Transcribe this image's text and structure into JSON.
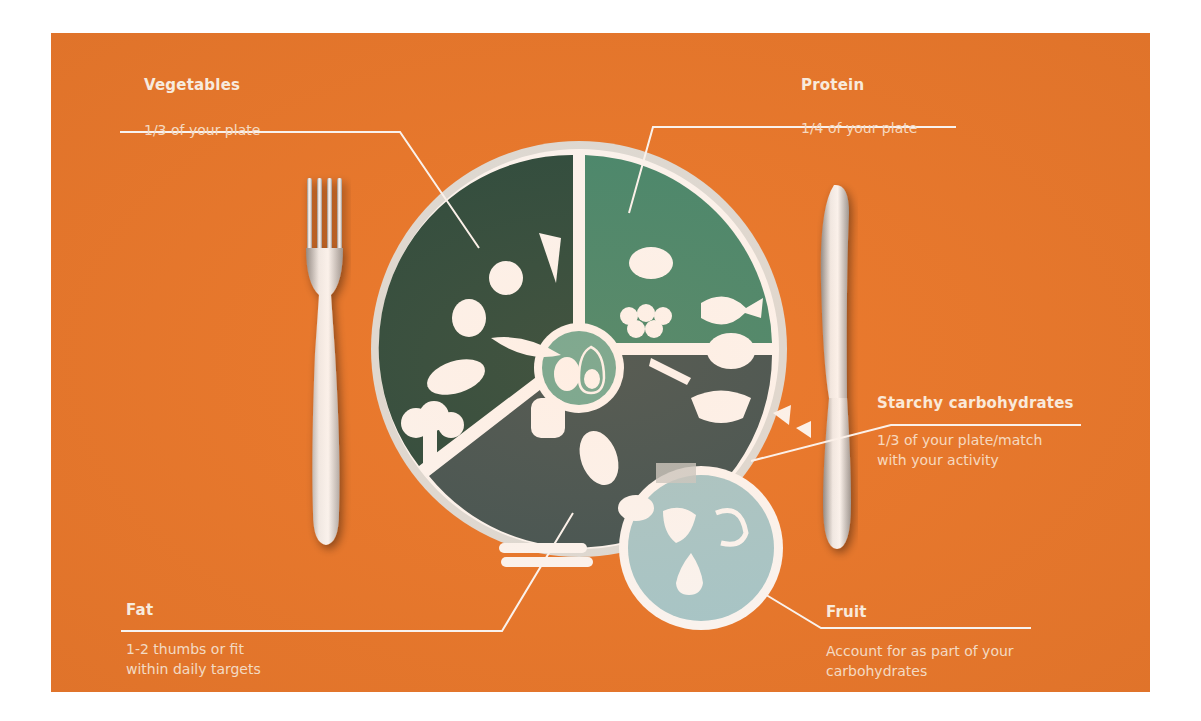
{
  "infographic": {
    "title": "Plate portion guide",
    "background_color": "#e9782c",
    "segments": [
      {
        "id": "vegetables",
        "title": "Vegetables",
        "description": "1/3 of your plate",
        "color": "#234a40",
        "icons": [
          "tomato-icon",
          "carrot-icon",
          "turnip-icon",
          "peapod-icon",
          "eggplant-icon",
          "bell-pepper-icon",
          "broccoli-icon"
        ]
      },
      {
        "id": "protein",
        "title": "Protein",
        "description": "1/4 of your plate",
        "color": "#3f8a72",
        "icons": [
          "ham-icon",
          "eggs-icon",
          "fish-icon",
          "lobster-icon",
          "roast-chicken-icon"
        ]
      },
      {
        "id": "starchy",
        "title": "Starchy carbohydrates",
        "description_lines": [
          "1/3 of your plate/match",
          "with your activity"
        ],
        "color": "#3c5457",
        "icons": [
          "rice-bowl-icon",
          "pasta-bow-icon",
          "croissant-icon",
          "fries-icon",
          "potato-icon",
          "baguette-icon"
        ]
      },
      {
        "id": "fat",
        "title": "Fat",
        "description_lines": [
          "1-2 thumbs or fit",
          "within daily targets"
        ],
        "color": "#6cae9d",
        "icons": [
          "egg-icon",
          "avocado-icon"
        ]
      },
      {
        "id": "fruit",
        "title": "Fruit",
        "description_lines": [
          "Account for as part of your",
          "carbohydrates"
        ],
        "color": "#a6cdd3",
        "icons": [
          "strawberry-icon",
          "banana-icon",
          "pear-icon"
        ]
      }
    ],
    "cutlery": [
      "fork",
      "knife"
    ]
  }
}
